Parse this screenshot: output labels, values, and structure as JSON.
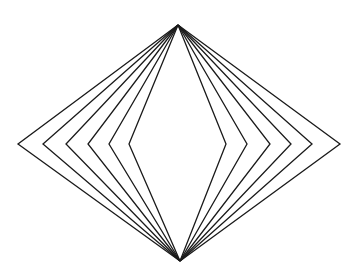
{
  "figure": {
    "stroke_color": "#1a1a1a",
    "background": "#ffffff",
    "top_apex": [
      178,
      25
    ],
    "bottom_apex": [
      180,
      261
    ],
    "mid_y": 144,
    "left_vertices_x": [
      18,
      43,
      66,
      88,
      109,
      129
    ],
    "right_vertices_x": [
      226,
      247,
      270,
      291,
      312,
      340
    ]
  }
}
